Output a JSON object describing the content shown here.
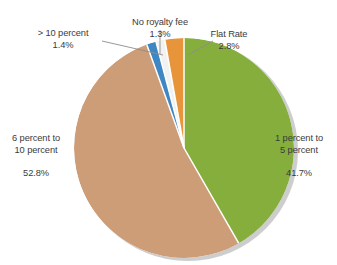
{
  "chart_data": {
    "type": "pie",
    "title": "",
    "subtitle": "",
    "xlabel": "",
    "ylabel": "",
    "legend_position": "none",
    "grid": false,
    "units": "percent",
    "labels_outside": true,
    "categories": [
      "1 percent to 5 percent",
      "6 percent to 10 percent",
      "> 10 percent",
      "No royalty fee",
      "Flat Rate"
    ],
    "values": [
      41.7,
      52.8,
      1.4,
      1.3,
      2.8
    ],
    "colors": [
      "#85AE3C",
      "#CD9D77",
      "#3F87C3",
      "#F2F2F0",
      "#E8943A"
    ],
    "slices": [
      {
        "name": "1 percent to 5 percent",
        "line1": "1 percent to",
        "line2": "5 percent",
        "percent_text": "41.7%",
        "value": 41.7,
        "color": "#85AE3C",
        "start_angle_deg": 6.1,
        "end_angle_deg": 156.2
      },
      {
        "name": "6 percent to 10 percent",
        "line1": "6 percent to",
        "line2": "10 percent",
        "percent_text": "52.8%",
        "value": 52.8,
        "color": "#CD9D77",
        "start_angle_deg": 156.2,
        "end_angle_deg": 346.3
      },
      {
        "name": "> 10 percent",
        "line1": "> 10 percent",
        "line2": "",
        "percent_text": "1.4%",
        "value": 1.4,
        "color": "#3F87C3",
        "start_angle_deg": 346.3,
        "end_angle_deg": 351.3
      },
      {
        "name": "No royalty fee",
        "line1": "No royalty fee",
        "line2": "",
        "percent_text": "1.3%",
        "value": 1.3,
        "color": "#F2F2F0",
        "start_angle_deg": 351.3,
        "end_angle_deg": 356.0
      },
      {
        "name": "Flat Rate",
        "line1": "Flat Rate",
        "line2": "",
        "percent_text": "2.8%",
        "value": 2.8,
        "color": "#E8943A",
        "start_angle_deg": 356.0,
        "end_angle_deg": 366.1
      }
    ],
    "total": 100.0
  },
  "labels": {
    "gt10": {
      "text": "> 10 percent",
      "percent": "1.4%"
    },
    "no_royalty_fee": {
      "text": "No royalty fee",
      "percent": "1.3%"
    },
    "flat_rate": {
      "text": "Flat Rate",
      "percent": "2.8%"
    },
    "six_to_ten": {
      "line1": "6 percent to",
      "line2": "10 percent",
      "percent": "52.8%"
    },
    "one_to_five": {
      "line1": "1 percent to",
      "line2": "5 percent",
      "percent": "41.7%"
    }
  },
  "style": {
    "background": "#ffffff",
    "text_color": "#3b3b3b",
    "shadow_color": "#9b9b9b",
    "slice_separator": "#ffffff"
  }
}
